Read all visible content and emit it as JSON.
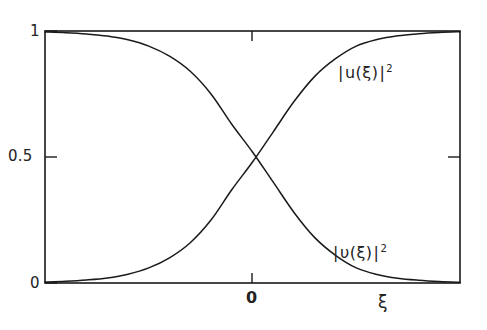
{
  "figure": {
    "background_color": "#ffffff",
    "line_color": "#1a1a1a"
  },
  "axes": {
    "y_ticks": [
      {
        "value": 1,
        "label": "1"
      },
      {
        "value": 0.5,
        "label": "0.5"
      },
      {
        "value": 0,
        "label": "0"
      }
    ],
    "x_ticks": [
      {
        "value": 0,
        "label": "0"
      }
    ],
    "x_axis_label": "ξ",
    "y_axis_label": ""
  },
  "labels": {
    "u_curve": {
      "open_bar": "|",
      "body": "u(ξ)",
      "close_bar": "|",
      "exponent": "2"
    },
    "v_curve": {
      "open_bar": "|",
      "body": "υ(ξ)",
      "close_bar": "|",
      "exponent": "2"
    }
  },
  "chart_data": {
    "type": "line",
    "title": "",
    "xlabel": "ξ",
    "ylabel": "",
    "xlim": [
      -5,
      5
    ],
    "ylim": [
      0,
      1
    ],
    "grid": false,
    "legend_position": "inline-right",
    "xticks": [
      0
    ],
    "xticklabels": [
      "0"
    ],
    "yticks": [
      0,
      0.5,
      1
    ],
    "yticklabels": [
      "0",
      "0.5",
      "1"
    ],
    "annotations": [
      {
        "text": "|u(ξ)|²",
        "x": 3.1,
        "y": 0.86
      },
      {
        "text": "|υ(ξ)|²",
        "x": 2.95,
        "y": 0.17
      }
    ],
    "series": [
      {
        "name": "|u(ξ)|²",
        "description": "BCS coherence factor, rises monotonically from 0 to 1",
        "x": [
          -5.0,
          -4.5,
          -4.0,
          -3.5,
          -3.0,
          -2.5,
          -2.0,
          -1.5,
          -1.0,
          -0.5,
          0.0,
          0.5,
          1.0,
          1.5,
          2.0,
          2.5,
          3.0,
          3.5,
          4.0,
          4.5,
          5.0
        ],
        "values": [
          0.004,
          0.007,
          0.012,
          0.02,
          0.035,
          0.06,
          0.1,
          0.16,
          0.25,
          0.37,
          0.48,
          0.6,
          0.72,
          0.82,
          0.89,
          0.94,
          0.966,
          0.981,
          0.989,
          0.994,
          0.997
        ]
      },
      {
        "name": "|υ(ξ)|²",
        "description": "BCS coherence factor, falls monotonically from 1 to 0",
        "x": [
          -5.0,
          -4.5,
          -4.0,
          -3.5,
          -3.0,
          -2.5,
          -2.0,
          -1.5,
          -1.0,
          -0.5,
          0.0,
          0.5,
          1.0,
          1.5,
          2.0,
          2.5,
          3.0,
          3.5,
          4.0,
          4.5,
          5.0
        ],
        "values": [
          0.996,
          0.993,
          0.988,
          0.98,
          0.965,
          0.94,
          0.9,
          0.84,
          0.75,
          0.63,
          0.52,
          0.4,
          0.28,
          0.18,
          0.11,
          0.06,
          0.034,
          0.019,
          0.011,
          0.006,
          0.003
        ]
      }
    ]
  }
}
